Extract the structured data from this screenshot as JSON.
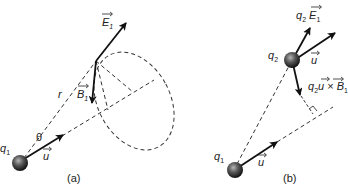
{
  "figure": {
    "panels": [
      {
        "id": "a",
        "caption": "(a)",
        "labels": {
          "charge": "q",
          "charge_sub": "1",
          "velocity": "u",
          "angle": "θ",
          "distance": "r",
          "electric_field": "E",
          "electric_field_sub": "1",
          "magnetic_field": "B",
          "magnetic_field_sub": "1"
        }
      },
      {
        "id": "b",
        "caption": "(b)",
        "labels": {
          "charge1": "q",
          "charge1_sub": "1",
          "charge2": "q",
          "charge2_sub": "2",
          "velocity_q1": "u",
          "velocity_q2": "u",
          "electric_force_q": "q",
          "electric_force_q_sub": "2",
          "electric_force_field": "E",
          "electric_force_field_sub": "1",
          "magnetic_force_q": "q",
          "magnetic_force_q_sub": "2",
          "magnetic_force_u": "u",
          "magnetic_force_cross": " × ",
          "magnetic_force_field": "B",
          "magnetic_force_field_sub": "1"
        }
      }
    ],
    "colors": {
      "line": "#111111",
      "dash": "#333333",
      "sphere_light": "#9a9a9a",
      "sphere_dark": "#1a1a1a"
    }
  }
}
